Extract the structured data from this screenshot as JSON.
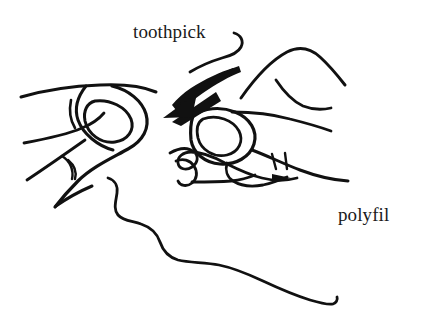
{
  "figure": {
    "kind": "line-drawing-illustration",
    "background_color": "#ffffff",
    "ink_color": "#111111",
    "width": 421,
    "height": 325,
    "labels": [
      {
        "id": "toothpick",
        "text": "toothpick",
        "x": 133,
        "y": 22,
        "leader": "curved line hooking down-right then sweeping left to the arrow tip"
      },
      {
        "id": "polyfil",
        "text": "polyfil",
        "x": 338,
        "y": 205,
        "leader": "none"
      }
    ],
    "annotations": {
      "arrow": {
        "name": "toothpick-arrow",
        "description": "Solid black tapered arrow with triangular head pointing down-left at the polyfil",
        "tip_x": 172,
        "tip_y": 118,
        "tail_x": 215,
        "tail_y": 96
      }
    },
    "objects": [
      {
        "name": "left-hand",
        "description": "Left hand seen from the side with thumb, thumbnail oval and knuckle crease marks"
      },
      {
        "name": "right-hand",
        "description": "Right hand with index finger and thumb pinching the toothpick"
      },
      {
        "name": "polyfil-thread",
        "description": "Tangled looping fiber strand below the fingers"
      },
      {
        "name": "long-thread",
        "description": "Long wavy thread trailing from lower-left to bottom-right"
      }
    ]
  }
}
